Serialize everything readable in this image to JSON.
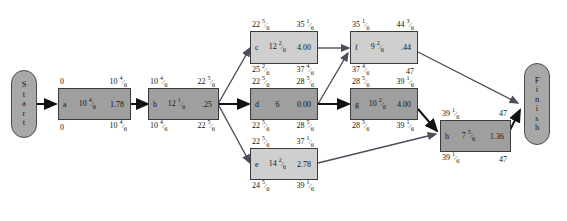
{
  "diagram": {
    "type": "pert-cpm-network",
    "title": "",
    "start_label_letters": [
      "S",
      "t",
      "a",
      "r",
      "t"
    ],
    "finish_label_letters": [
      "F",
      "i",
      "n",
      "i",
      "s",
      "h"
    ],
    "colors": {
      "critical_fill": "#9f9f9f",
      "slack_fill": "#cfcfcf",
      "terminal_fill": "#a8a8a8",
      "border": "#3a3a3a",
      "edge_critical": "#111111",
      "edge_normal": "#4d4d5c",
      "background": "#ffffff"
    },
    "nodes": [
      {
        "id": "a",
        "label": "a",
        "duration": "10 4/6",
        "variance": "1.78",
        "es": "0",
        "ef": "10 4/6",
        "ls": "0",
        "lf": "10 4/6",
        "critical": true
      },
      {
        "id": "b",
        "label": "b",
        "duration": "12 1/6",
        "variance": ".25",
        "es": "10 4/6",
        "ef": "22 5/6",
        "ls": "10 4/6",
        "lf": "22 5/6",
        "critical": true
      },
      {
        "id": "c",
        "label": "c",
        "duration": "12 2/6",
        "variance": "4.00",
        "es": "22 5/6",
        "ef": "35 1/6",
        "ls": "25 2/6",
        "lf": "37 4/6",
        "critical": false
      },
      {
        "id": "d",
        "label": "d",
        "duration": "6",
        "variance": "0.00",
        "es": "22 5/6",
        "ef": "28 5/6",
        "ls": "22 5/6",
        "lf": "28 5/6",
        "critical": true
      },
      {
        "id": "e",
        "label": "e",
        "duration": "14 2/6",
        "variance": "2.78",
        "es": "22 5/6",
        "ef": "37 1/6",
        "ls": "24 5/6",
        "lf": "39 1/6",
        "critical": false
      },
      {
        "id": "f",
        "label": "f",
        "duration": "9 2/6",
        "variance": ".44",
        "es": "35 1/6",
        "ef": "44 3/6",
        "ls": "37 4/6",
        "lf": "47",
        "critical": false
      },
      {
        "id": "g",
        "label": "g",
        "duration": "10 2/6",
        "variance": "4.00",
        "es": "28 5/6",
        "ef": "39 1/6",
        "ls": "28 5/6",
        "lf": "39 1/6",
        "critical": true
      },
      {
        "id": "h",
        "label": "h",
        "duration": "7 5/6",
        "variance": "1.36",
        "es": "39 1/6",
        "ef": "47",
        "ls": "39 1/6",
        "lf": "47",
        "critical": true
      }
    ],
    "edges": [
      {
        "from": "start",
        "to": "a",
        "critical": true
      },
      {
        "from": "a",
        "to": "b",
        "critical": true
      },
      {
        "from": "b",
        "to": "c",
        "critical": false
      },
      {
        "from": "b",
        "to": "d",
        "critical": true
      },
      {
        "from": "b",
        "to": "e",
        "critical": false
      },
      {
        "from": "c",
        "to": "f",
        "critical": false
      },
      {
        "from": "d",
        "to": "f",
        "critical": false
      },
      {
        "from": "d",
        "to": "g",
        "critical": true
      },
      {
        "from": "e",
        "to": "h",
        "critical": false
      },
      {
        "from": "f",
        "to": "finish",
        "critical": false
      },
      {
        "from": "g",
        "to": "h",
        "critical": true
      },
      {
        "from": "h",
        "to": "finish",
        "critical": true
      }
    ]
  }
}
